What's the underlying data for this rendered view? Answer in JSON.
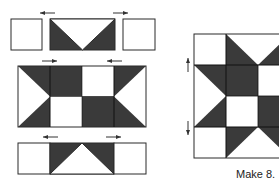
{
  "colors": {
    "dark": "#3a3a3a",
    "light": "#ffffff",
    "line": "#2a2a2a",
    "arrow": "#333333"
  },
  "caption": "Make 8.",
  "assembly": {
    "top_row": [
      "square-light",
      "flying-geese-dark-sides-point-down",
      "square-light"
    ],
    "middle_row": {
      "top": [
        "hst",
        "dark",
        "light",
        "hst"
      ],
      "bottom": [
        "hst",
        "light",
        "dark",
        "hst"
      ]
    },
    "bottom_row": [
      "square-light",
      "flying-geese-dark-sides-point-up",
      "square-light"
    ],
    "pressing_arrows": [
      "left",
      "right",
      "right",
      "left",
      "left",
      "right"
    ]
  },
  "finished_block": {
    "rows": 4,
    "visible_columns": 3,
    "side_arrows": [
      "up",
      "down"
    ]
  }
}
